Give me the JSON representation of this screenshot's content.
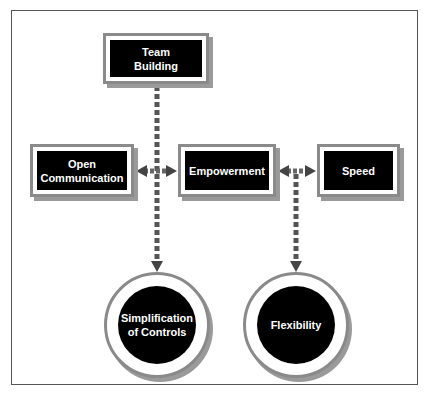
{
  "diagram": {
    "nodes": {
      "team_building": {
        "label": "Team\nBuilding",
        "shape": "box"
      },
      "open_communication": {
        "label": "Open\nCommunication",
        "shape": "box"
      },
      "empowerment": {
        "label": "Empowerment",
        "shape": "box"
      },
      "speed": {
        "label": "Speed",
        "shape": "box"
      },
      "simplification_of_controls": {
        "label": "Simplification\nof Controls",
        "shape": "circle"
      },
      "flexibility": {
        "label": "Flexibility",
        "shape": "circle"
      }
    },
    "edges": [
      {
        "from": "team_building",
        "to": "simplification_of_controls",
        "style": "dashed-arrow"
      },
      {
        "from": "open_communication",
        "to": "empowerment",
        "style": "double-arrow"
      },
      {
        "from": "empowerment",
        "to": "speed",
        "style": "double-arrow"
      },
      {
        "from": "empowerment-speed-link",
        "to": "flexibility",
        "style": "dashed-arrow"
      }
    ],
    "colors": {
      "node_fill": "#000000",
      "node_text": "#ffffff",
      "border": "#8a8a8a",
      "connector": "#555555"
    }
  }
}
